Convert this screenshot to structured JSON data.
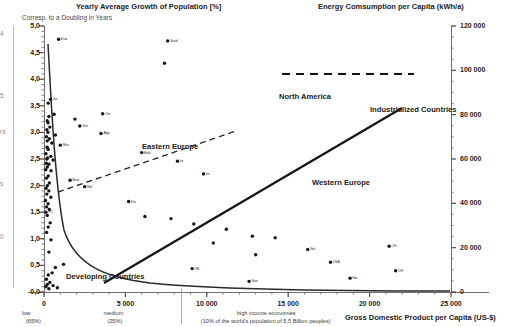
{
  "titles": {
    "left_axis_title": "Yearly Average Growth of Population [%]",
    "left_axis_subtitle": "Corresp. to a Doubling in Years",
    "right_axis_title": "Energy Comsumption per Capita (kWh/a)",
    "bottom_axis_title": "Gross Domestic Product per Capita (US-$)"
  },
  "annotations": [
    {
      "text": "North America",
      "x": 279,
      "y": 92
    },
    {
      "text": "Industrialized Countries",
      "x": 370,
      "y": 105
    },
    {
      "text": "Eastern Europe",
      "x": 142,
      "y": 142
    },
    {
      "text": "Western Europe",
      "x": 312,
      "y": 178
    },
    {
      "text": "Developing Countries",
      "x": 66,
      "y": 272
    }
  ],
  "edge_labels": [
    {
      "text": "4",
      "x": 0,
      "y": 30
    },
    {
      "text": "5",
      "x": 0,
      "y": 92
    },
    {
      "text": "rs",
      "x": 0,
      "y": 128
    },
    {
      "text": "s",
      "x": 0,
      "y": 180
    },
    {
      "text": "0",
      "x": 0,
      "y": 233
    }
  ],
  "chart_data": {
    "type": "scatter",
    "xlabel": "Gross Domestic Product per Capita (US-$)",
    "ylabel": "Yearly Average Growth of Population [%]",
    "y2label": "Energy Comsumption per Capita (kWh/a)",
    "xlim": [
      0,
      25000
    ],
    "ylim": [
      0,
      5.0
    ],
    "y2lim": [
      0,
      120000
    ],
    "grid": false,
    "legend": "none",
    "x_ticks": [
      {
        "value": 0,
        "label": "0"
      },
      {
        "value": 5000,
        "label": "5 000"
      },
      {
        "value": 10000,
        "label": "10 000"
      },
      {
        "value": 15000,
        "label": "15 000"
      },
      {
        "value": 20000,
        "label": "20 000"
      },
      {
        "value": 25000,
        "label": "25 000"
      }
    ],
    "x_tick_notes": [
      {
        "value": 0,
        "label": "low",
        "sub": "(65%)"
      },
      {
        "value": 5000,
        "label": "medium",
        "sub": "(25%)"
      },
      {
        "value": 10000,
        "label": "high income economies",
        "sub": "(10% of the world's population of 5,5 Billion peoples)"
      }
    ],
    "y_ticks": [
      {
        "value": 5.0,
        "label": "5,0"
      },
      {
        "value": 4.5,
        "label": "4,5"
      },
      {
        "value": 4.0,
        "label": "4,0"
      },
      {
        "value": 3.5,
        "label": "3,5"
      },
      {
        "value": 3.0,
        "label": "3,0"
      },
      {
        "value": 2.5,
        "label": "2,5"
      },
      {
        "value": 2.0,
        "label": "2,0"
      },
      {
        "value": 1.5,
        "label": "1,5"
      },
      {
        "value": 1.0,
        "label": "1,0"
      },
      {
        "value": 0.5,
        "label": "0,5"
      },
      {
        "value": 0.0,
        "label": "0,0"
      }
    ],
    "y2_ticks": [
      {
        "value": 0,
        "label": "0"
      },
      {
        "value": 20000,
        "label": "20 000"
      },
      {
        "value": 40000,
        "label": "40 000"
      },
      {
        "value": 60000,
        "label": "60 000"
      },
      {
        "value": 80000,
        "label": "80 000"
      },
      {
        "value": 100000,
        "label": "100 000"
      },
      {
        "value": 120000,
        "label": "120 000"
      }
    ],
    "series": [
      {
        "name": "Population growth vs GDP per capita",
        "marker": "filled-circle",
        "color": "#141414",
        "points": [
          {
            "x": 900,
            "y": 4.75,
            "label": "Kuw"
          },
          {
            "x": 7600,
            "y": 4.72,
            "label": "Saud"
          },
          {
            "x": 7400,
            "y": 4.3,
            "label": ""
          },
          {
            "x": 400,
            "y": 3.62,
            "label": "Jor"
          },
          {
            "x": 260,
            "y": 3.55,
            "label": ""
          },
          {
            "x": 3600,
            "y": 3.35,
            "label": "Om"
          },
          {
            "x": 620,
            "y": 3.34,
            "label": ""
          },
          {
            "x": 300,
            "y": 3.3,
            "label": ""
          },
          {
            "x": 1900,
            "y": 3.25,
            "label": ""
          },
          {
            "x": 200,
            "y": 3.22,
            "label": ""
          },
          {
            "x": 250,
            "y": 3.18,
            "label": ""
          },
          {
            "x": 2200,
            "y": 3.12,
            "label": "Ven"
          },
          {
            "x": 360,
            "y": 3.1,
            "label": ""
          },
          {
            "x": 180,
            "y": 3.05,
            "label": ""
          },
          {
            "x": 240,
            "y": 3.0,
            "label": ""
          },
          {
            "x": 3500,
            "y": 2.98,
            "label": "Alge"
          },
          {
            "x": 700,
            "y": 2.95,
            "label": ""
          },
          {
            "x": 150,
            "y": 2.92,
            "label": ""
          },
          {
            "x": 330,
            "y": 2.88,
            "label": ""
          },
          {
            "x": 200,
            "y": 2.84,
            "label": ""
          },
          {
            "x": 480,
            "y": 2.8,
            "label": ""
          },
          {
            "x": 1000,
            "y": 2.76,
            "label": "Mex"
          },
          {
            "x": 190,
            "y": 2.72,
            "label": ""
          },
          {
            "x": 260,
            "y": 2.68,
            "label": ""
          },
          {
            "x": 6000,
            "y": 2.62,
            "label": "Bahr"
          },
          {
            "x": 120,
            "y": 2.6,
            "label": ""
          },
          {
            "x": 420,
            "y": 2.55,
            "label": ""
          },
          {
            "x": 220,
            "y": 2.52,
            "label": ""
          },
          {
            "x": 170,
            "y": 2.5,
            "label": ""
          },
          {
            "x": 560,
            "y": 2.48,
            "label": ""
          },
          {
            "x": 8200,
            "y": 2.46,
            "label": "Isr"
          },
          {
            "x": 140,
            "y": 2.42,
            "label": ""
          },
          {
            "x": 300,
            "y": 2.4,
            "label": ""
          },
          {
            "x": 200,
            "y": 2.35,
            "label": ""
          },
          {
            "x": 110,
            "y": 2.3,
            "label": ""
          },
          {
            "x": 430,
            "y": 2.28,
            "label": ""
          },
          {
            "x": 9800,
            "y": 2.22,
            "label": "Ire"
          },
          {
            "x": 260,
            "y": 2.18,
            "label": ""
          },
          {
            "x": 150,
            "y": 2.14,
            "label": ""
          },
          {
            "x": 1600,
            "y": 2.1,
            "label": "Braz"
          },
          {
            "x": 330,
            "y": 2.05,
            "label": ""
          },
          {
            "x": 210,
            "y": 2.0,
            "label": ""
          },
          {
            "x": 2500,
            "y": 1.98,
            "label": "Mal"
          },
          {
            "x": 130,
            "y": 1.95,
            "label": ""
          },
          {
            "x": 300,
            "y": 1.9,
            "label": ""
          },
          {
            "x": 170,
            "y": 1.84,
            "label": ""
          },
          {
            "x": 420,
            "y": 1.78,
            "label": ""
          },
          {
            "x": 90,
            "y": 1.72,
            "label": ""
          },
          {
            "x": 5200,
            "y": 1.7,
            "label": "Kor"
          },
          {
            "x": 250,
            "y": 1.66,
            "label": ""
          },
          {
            "x": 160,
            "y": 1.6,
            "label": ""
          },
          {
            "x": 330,
            "y": 1.55,
            "label": ""
          },
          {
            "x": 120,
            "y": 1.5,
            "label": "PC"
          },
          {
            "x": 200,
            "y": 1.44,
            "label": ""
          },
          {
            "x": 6200,
            "y": 1.42,
            "label": ""
          },
          {
            "x": 7800,
            "y": 1.38,
            "label": ""
          },
          {
            "x": 380,
            "y": 1.3,
            "label": ""
          },
          {
            "x": 9200,
            "y": 1.28,
            "label": ""
          },
          {
            "x": 260,
            "y": 1.22,
            "label": ""
          },
          {
            "x": 11200,
            "y": 1.18,
            "label": ""
          },
          {
            "x": 160,
            "y": 1.12,
            "label": ""
          },
          {
            "x": 12800,
            "y": 1.05,
            "label": ""
          },
          {
            "x": 14200,
            "y": 1.02,
            "label": ""
          },
          {
            "x": 430,
            "y": 0.98,
            "label": ""
          },
          {
            "x": 10400,
            "y": 0.92,
            "label": ""
          },
          {
            "x": 21200,
            "y": 0.86,
            "label": "CH"
          },
          {
            "x": 16200,
            "y": 0.8,
            "label": "Net"
          },
          {
            "x": 300,
            "y": 0.75,
            "label": ""
          },
          {
            "x": 13000,
            "y": 0.7,
            "label": ""
          },
          {
            "x": 17600,
            "y": 0.56,
            "label": "USA"
          },
          {
            "x": 1200,
            "y": 0.52,
            "label": ""
          },
          {
            "x": 700,
            "y": 0.46,
            "label": ""
          },
          {
            "x": 9100,
            "y": 0.44,
            "label": "GB"
          },
          {
            "x": 21600,
            "y": 0.4,
            "label": "CH"
          },
          {
            "x": 500,
            "y": 0.36,
            "label": ""
          },
          {
            "x": 260,
            "y": 0.32,
            "label": ""
          },
          {
            "x": 18800,
            "y": 0.26,
            "label": "Nor"
          },
          {
            "x": 150,
            "y": 0.24,
            "label": ""
          },
          {
            "x": 12600,
            "y": 0.2,
            "label": "Swe"
          },
          {
            "x": 360,
            "y": 0.18,
            "label": ""
          },
          {
            "x": 200,
            "y": 0.14,
            "label": ""
          },
          {
            "x": 560,
            "y": 0.12,
            "label": ""
          },
          {
            "x": 120,
            "y": 0.1,
            "label": ""
          },
          {
            "x": 820,
            "y": 0.08,
            "label": ""
          },
          {
            "x": 300,
            "y": 0.06,
            "label": ""
          }
        ]
      }
    ],
    "trend_lines": [
      {
        "name": "Developing Countries",
        "style": "solid",
        "description": "decreasing curve from high growth at low GDP flattening toward zero"
      },
      {
        "name": "Industrialized Countries",
        "style": "solid",
        "description": "rising energy consumption line from ~7000 to ~22000 US-$"
      },
      {
        "name": "North America",
        "style": "dashed",
        "description": "horizontal dashed line near 100 000 kWh/a"
      },
      {
        "name": "Eastern Europe",
        "style": "dashed",
        "description": "rising dashed line across low-to-mid GDP range"
      }
    ]
  }
}
